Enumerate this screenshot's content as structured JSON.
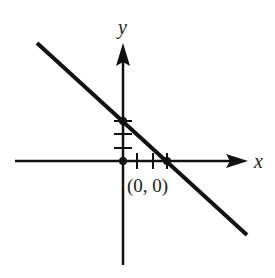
{
  "diagram": {
    "type": "coordinate-plane-line",
    "axes": {
      "x_label": "x",
      "y_label": "y"
    },
    "origin_label": "(0, 0)",
    "line": {
      "description": "line with negative slope crossing positive y-axis and positive x-axis",
      "y_intercept_ticks": 3,
      "x_intercept_ticks": 3
    },
    "colors": {
      "stroke": "#111111",
      "background": "#ffffff"
    }
  }
}
